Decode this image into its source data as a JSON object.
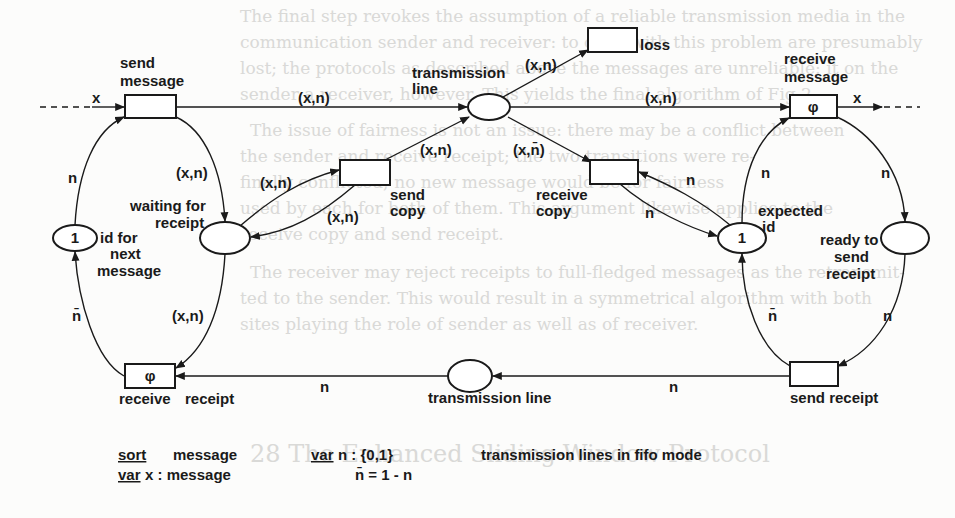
{
  "diagram": {
    "type": "petri-net",
    "colors": {
      "ink": "#1a1a1a",
      "paper": "#fcfcfb",
      "show_through": "#d9d9d7"
    },
    "transitions": {
      "send_message": {
        "label_line1": "send",
        "label_line2": "message"
      },
      "loss": {
        "label": "loss"
      },
      "receive_message": {
        "label_line1": "receive",
        "label_line2": "message",
        "inscription": "φ"
      },
      "send_copy": {
        "label_line1": "send",
        "label_line2": "copy"
      },
      "receive_copy": {
        "label_line1": "receive",
        "label_line2": "copy"
      },
      "receive_receipt": {
        "label_line1": "receive",
        "label_line2": "receipt",
        "inscription": "φ"
      },
      "send_receipt": {
        "label": "send receipt"
      }
    },
    "places": {
      "transmission_line_top": {
        "label_line1": "transmission",
        "label_line2": "line"
      },
      "id_for_next_message": {
        "token": "1",
        "label_line1": "id for",
        "label_line2": "next",
        "label_line3": "message"
      },
      "waiting_for_receipt": {
        "label_line1": "waiting for",
        "label_line2": "receipt"
      },
      "expected_id": {
        "token": "1",
        "label_line1": "expected",
        "label_line2": "id"
      },
      "ready_to_send_receipt": {
        "label_line1": "ready to",
        "label_line2": "send",
        "label_line3": "receipt"
      },
      "transmission_line_bottom": {
        "label": "transmission line"
      }
    },
    "arc_labels": {
      "in_x": "x",
      "out_x": "x",
      "send_to_line": "(x,n)",
      "line_to_loss": "(x,n)",
      "line_to_receive": "(x,n)",
      "sendcopy_to_line": "(x,n)",
      "line_to_receivecopy": "(x,n̄)",
      "send_to_waiting": "(x,n)",
      "waiting_to_sendcopy": "(x,n)",
      "sendcopy_to_waiting": "(x,n)",
      "waiting_to_receipt": "(x,n)",
      "id_to_send": "n",
      "receipt_to_id": "n̄",
      "receivecopy_from_expected": "n",
      "expected_to_receivecopy": "n",
      "expected_to_receive": "n",
      "receive_to_ready": "n",
      "sendreceipt_to_expected": "n̄",
      "ready_to_sendreceipt": "n",
      "sendreceipt_to_line": "n",
      "line_to_receivereceipt": "n"
    },
    "legend": {
      "sort_kw": "sort",
      "sort_val": "message",
      "var_x_kw": "var",
      "var_x_val": " x : message",
      "var_n_kw": "var",
      "var_n_val": " n : {0,1}",
      "nbar_def": "n̄ = 1 - n",
      "fifo_note": "transmission lines in fifo mode"
    },
    "show_through_text": [
      "The final step revokes the assumption of a reliable transmission media in the",
      "communication sender and receiver: to cope with this problem are presumably",
      "lost; the protocols as described above the messages are unreliable: it on the",
      "sender a receiver, however. This yields the final algorithm of Fig 2",
      "The issue of fairness is not an issue: there may be a conflict between",
      "the sender and receive receipt; the two transitions were re-",
      "finally conflicted; no new message would be for fairness",
      "used by each for both of them. This argument likewise applies to the",
      "receive copy and send receipt.",
      "The receiver may reject receipts to full-fledged messages as the retransmit-",
      "ted to the sender. This would result in a symmetrical algorithm with both",
      "sites playing the role of sender as well as of receiver.",
      "28   The Enhanced Sliding-Window Protocol"
    ]
  }
}
